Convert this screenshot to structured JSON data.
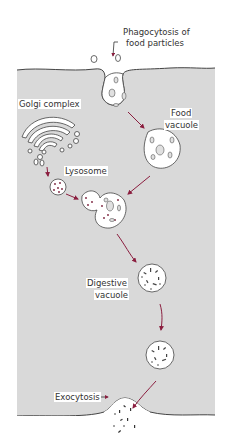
{
  "colors": {
    "cytoplasm": "#d9d9d9",
    "membrane": "#444444",
    "arrow": "#8b1e3f",
    "vesicle_fill": "#ffffff",
    "particle": "#555555",
    "enzyme_dot": "#7a1e3a"
  },
  "labels": {
    "phagocytosis": [
      "Phagocytosis of",
      "food particles"
    ],
    "golgi": "Golgi complex",
    "food_vacuole": [
      "Food",
      "vacuole"
    ],
    "lysosome": "Lysosome",
    "digestive_vacuole": [
      "Digestive",
      "vacuole"
    ],
    "exocytosis": "Exocytosis"
  },
  "steps": [
    "Phagocytosis of food particles",
    "Food vacuole",
    "Golgi complex",
    "Lysosome",
    "Lysosome fuses with food vacuole",
    "Digestive vacuole",
    "Residual body",
    "Exocytosis"
  ]
}
